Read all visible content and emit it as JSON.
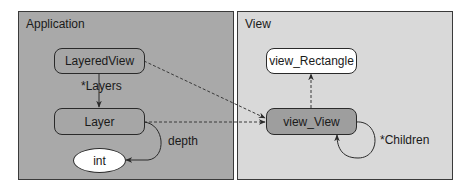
{
  "panels": {
    "application": {
      "title": "Application"
    },
    "view": {
      "title": "View"
    }
  },
  "nodes": {
    "layered_view": "LayeredView",
    "layer": "Layer",
    "int": "int",
    "view_rectangle": "view_Rectangle",
    "view_view": "view_View"
  },
  "edges": {
    "layers": "*Layers",
    "depth": "depth",
    "children": "*Children"
  },
  "colors": {
    "application_bg": "#a9a9a9",
    "view_bg": "#d9d9d9",
    "border": "#2a2a2a"
  }
}
